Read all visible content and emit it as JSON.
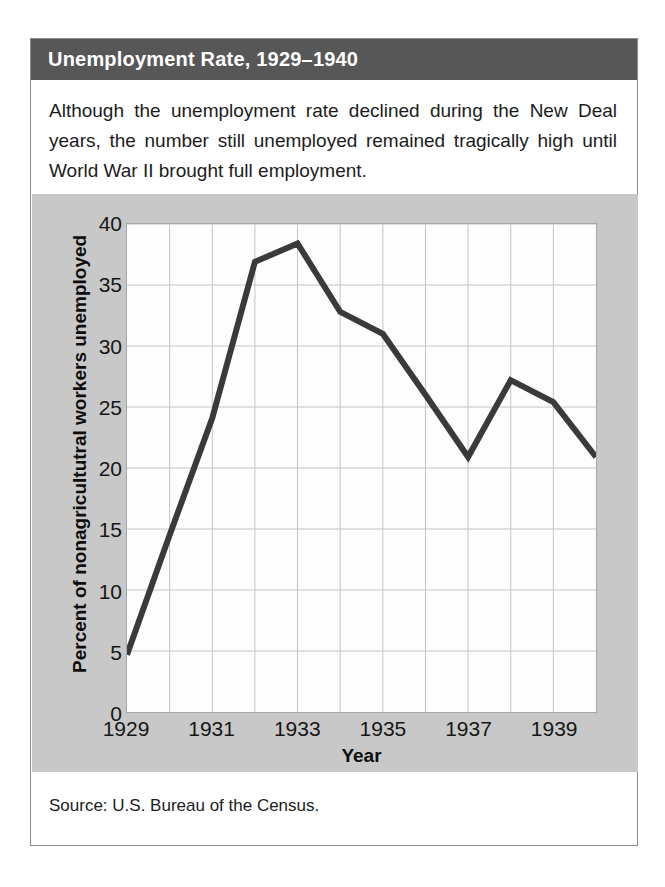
{
  "figure": {
    "title": "Unemployment Rate, 1929–1940",
    "caption": "Although the unemployment rate declined during the New Deal years, the number still unemployed remained tragically high until World War II brought full employment.",
    "source": "Source: U.S. Bureau of the Census."
  },
  "colors": {
    "header_bg": "#575757",
    "header_text": "#ffffff",
    "panel_bg": "#c8c8c8",
    "plot_bg": "#fdfdfd",
    "grid": "#c4c4c4",
    "line": "#3a3a3a",
    "frame": "#a8a8a8"
  },
  "chart_data": {
    "type": "line",
    "title": "Unemployment Rate, 1929–1940",
    "xlabel": "Year",
    "ylabel": "Percent of nonagricultutral workers unemployed",
    "x": [
      1929,
      1930,
      1931,
      1932,
      1933,
      1934,
      1935,
      1936,
      1937,
      1938,
      1939,
      1940
    ],
    "values": [
      4.7,
      14.5,
      24.1,
      36.9,
      38.4,
      32.8,
      31.0,
      26.0,
      20.9,
      27.2,
      25.4,
      20.9
    ],
    "xlim": [
      1929,
      1940
    ],
    "ylim": [
      0,
      40
    ],
    "yticks": [
      0,
      5,
      10,
      15,
      20,
      25,
      30,
      35,
      40
    ],
    "xticks": [
      1929,
      1931,
      1933,
      1935,
      1937,
      1939
    ],
    "xtick_labels": [
      "1929",
      "1931",
      "1933",
      "1935",
      "1937",
      "1939"
    ],
    "ytick_labels": [
      "0",
      "5",
      "10",
      "15",
      "20",
      "25",
      "30",
      "35",
      "40"
    ],
    "grid": true,
    "legend": null,
    "series_name": "Unemployment rate"
  }
}
